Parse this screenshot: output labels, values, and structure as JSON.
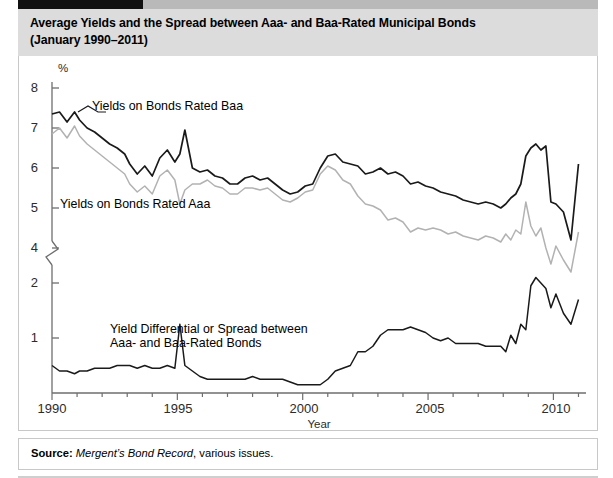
{
  "figure": {
    "title_line1": "Average Yields and the Spread between Aaa- and Baa-Rated Municipal Bonds",
    "title_line2": "(January 1990–2011)",
    "source_lead": "Source:",
    "source_italic": "Mergent’s Bond Record",
    "source_tail": ", various issues."
  },
  "annotations": {
    "baa_label": "Yields on Bonds Rated Baa",
    "aaa_label": "Yields on Bonds Rated Aaa",
    "spread_label_line1": "Yield Differential or Spread between",
    "spread_label_line2": "Aaa- and Baa-Rated Bonds"
  },
  "colors": {
    "baa_line": "#1a1a1a",
    "aaa_line": "#b2b2b2",
    "spread_line": "#1a1a1a",
    "axis": "#6e6e6e",
    "title_band": "#dcdcdc",
    "tab": "#111111"
  },
  "chart_data": {
    "type": "line",
    "title": "Average Yields and the Spread between Aaa- and Baa-Rated Municipal Bonds (January 1990–2011)",
    "xlabel": "Year",
    "ylabel": "%",
    "grid": false,
    "legend_position": "inline-annotations",
    "axis_note": "Y axis is broken between 4 and 2 (zigzag break mark); upper segment 4–8 for yields, lower segment 0–2 for the spread",
    "xlim": [
      1990,
      2011.3
    ],
    "xticks": [
      1990,
      1995,
      2000,
      2005,
      2010
    ],
    "xtick_labels": [
      "1990",
      "1995",
      "2000",
      "2005",
      "2010"
    ],
    "xminor_step": 1,
    "yticks_upper": [
      4,
      5,
      6,
      7,
      8
    ],
    "ytick_labels_upper": [
      "4",
      "5",
      "6",
      "7",
      "8"
    ],
    "yticks_lower": [
      1,
      2
    ],
    "ytick_labels_lower": [
      "1",
      "2"
    ],
    "ylim_upper": [
      3.4,
      8.3
    ],
    "ylim_lower": [
      0,
      2.35
    ],
    "series": [
      {
        "name": "Yields on Bonds Rated Baa",
        "axis": "upper",
        "color": "#1a1a1a",
        "x": [
          1990.0,
          1990.3,
          1990.6,
          1990.9,
          1991.1,
          1991.4,
          1991.7,
          1992.0,
          1992.3,
          1992.6,
          1992.9,
          1993.1,
          1993.4,
          1993.7,
          1994.0,
          1994.3,
          1994.6,
          1994.9,
          1995.1,
          1995.3,
          1995.6,
          1995.9,
          1996.2,
          1996.5,
          1996.8,
          1997.1,
          1997.4,
          1997.7,
          1998.0,
          1998.3,
          1998.6,
          1998.9,
          1999.2,
          1999.5,
          1999.8,
          2000.1,
          2000.4,
          2000.7,
          2001.0,
          2001.3,
          2001.6,
          2001.9,
          2002.2,
          2002.5,
          2002.8,
          2003.1,
          2003.4,
          2003.7,
          2004.0,
          2004.3,
          2004.6,
          2004.9,
          2005.2,
          2005.5,
          2005.8,
          2006.1,
          2006.4,
          2006.7,
          2007.0,
          2007.3,
          2007.6,
          2007.9,
          2008.1,
          2008.3,
          2008.5,
          2008.7,
          2008.9,
          2009.1,
          2009.3,
          2009.5,
          2009.7,
          2009.9,
          2010.1,
          2010.4,
          2010.7,
          2011.0
        ],
        "y": [
          7.35,
          7.4,
          7.15,
          7.4,
          7.2,
          7.0,
          6.9,
          6.75,
          6.6,
          6.5,
          6.35,
          6.1,
          5.85,
          6.05,
          5.8,
          6.25,
          6.45,
          6.15,
          6.35,
          6.95,
          6.0,
          5.9,
          5.95,
          5.8,
          5.75,
          5.6,
          5.6,
          5.75,
          5.8,
          5.7,
          5.75,
          5.6,
          5.45,
          5.35,
          5.4,
          5.55,
          5.6,
          6.0,
          6.3,
          6.35,
          6.15,
          6.1,
          6.05,
          5.85,
          5.9,
          6.0,
          5.85,
          5.9,
          5.8,
          5.6,
          5.65,
          5.55,
          5.5,
          5.4,
          5.35,
          5.3,
          5.2,
          5.15,
          5.1,
          5.15,
          5.1,
          5.0,
          5.1,
          5.25,
          5.35,
          5.6,
          6.3,
          6.5,
          6.6,
          6.45,
          6.55,
          5.15,
          5.1,
          4.9,
          4.2,
          6.1
        ]
      },
      {
        "name": "Yields on Bonds Rated Aaa",
        "axis": "upper",
        "color": "#b2b2b2",
        "x": [
          1990.0,
          1990.3,
          1990.6,
          1990.9,
          1991.1,
          1991.4,
          1991.7,
          1992.0,
          1992.3,
          1992.6,
          1992.9,
          1993.1,
          1993.4,
          1993.7,
          1994.0,
          1994.3,
          1994.6,
          1994.9,
          1995.1,
          1995.3,
          1995.6,
          1995.9,
          1996.2,
          1996.5,
          1996.8,
          1997.1,
          1997.4,
          1997.7,
          1998.0,
          1998.3,
          1998.6,
          1998.9,
          1999.2,
          1999.5,
          1999.8,
          2000.1,
          2000.4,
          2000.7,
          2001.0,
          2001.3,
          2001.6,
          2001.9,
          2002.2,
          2002.5,
          2002.8,
          2003.1,
          2003.4,
          2003.7,
          2004.0,
          2004.3,
          2004.6,
          2004.9,
          2005.2,
          2005.5,
          2005.8,
          2006.1,
          2006.4,
          2006.7,
          2007.0,
          2007.3,
          2007.6,
          2007.9,
          2008.1,
          2008.3,
          2008.5,
          2008.7,
          2008.9,
          2009.1,
          2009.3,
          2009.5,
          2009.7,
          2009.9,
          2010.1,
          2010.4,
          2010.7,
          2011.0
        ],
        "y": [
          6.85,
          7.0,
          6.75,
          7.05,
          6.8,
          6.6,
          6.45,
          6.3,
          6.15,
          6.0,
          5.85,
          5.6,
          5.4,
          5.55,
          5.35,
          5.8,
          5.95,
          5.7,
          5.1,
          5.45,
          5.6,
          5.6,
          5.7,
          5.55,
          5.5,
          5.35,
          5.35,
          5.5,
          5.5,
          5.45,
          5.5,
          5.35,
          5.2,
          5.15,
          5.25,
          5.4,
          5.45,
          5.85,
          6.05,
          5.95,
          5.7,
          5.6,
          5.3,
          5.1,
          5.05,
          4.95,
          4.7,
          4.75,
          4.65,
          4.4,
          4.5,
          4.45,
          4.5,
          4.45,
          4.35,
          4.4,
          4.3,
          4.25,
          4.2,
          4.3,
          4.25,
          4.15,
          4.35,
          4.2,
          4.45,
          4.35,
          5.15,
          4.55,
          4.3,
          4.5,
          4.0,
          3.6,
          4.05,
          3.7,
          3.4,
          4.4
        ]
      },
      {
        "name": "Yield Differential or Spread between Aaa- and Baa-Rated Bonds",
        "axis": "lower",
        "color": "#1a1a1a",
        "x": [
          1990.0,
          1990.3,
          1990.6,
          1990.9,
          1991.1,
          1991.4,
          1991.7,
          1992.0,
          1992.3,
          1992.6,
          1992.9,
          1993.1,
          1993.4,
          1993.7,
          1994.0,
          1994.3,
          1994.6,
          1994.9,
          1995.1,
          1995.3,
          1995.6,
          1995.9,
          1996.2,
          1996.5,
          1996.8,
          1997.1,
          1997.4,
          1997.7,
          1998.0,
          1998.3,
          1998.6,
          1998.9,
          1999.2,
          1999.5,
          1999.8,
          2000.1,
          2000.4,
          2000.7,
          2001.0,
          2001.3,
          2001.6,
          2001.9,
          2002.2,
          2002.5,
          2002.8,
          2003.1,
          2003.4,
          2003.7,
          2004.0,
          2004.3,
          2004.6,
          2004.9,
          2005.2,
          2005.5,
          2005.8,
          2006.1,
          2006.4,
          2006.7,
          2007.0,
          2007.3,
          2007.6,
          2007.9,
          2008.1,
          2008.3,
          2008.5,
          2008.7,
          2008.9,
          2009.1,
          2009.3,
          2009.5,
          2009.7,
          2009.9,
          2010.1,
          2010.4,
          2010.7,
          2011.0
        ],
        "y": [
          0.5,
          0.4,
          0.4,
          0.35,
          0.4,
          0.4,
          0.45,
          0.45,
          0.45,
          0.5,
          0.5,
          0.5,
          0.45,
          0.5,
          0.45,
          0.45,
          0.5,
          0.45,
          1.25,
          0.5,
          0.4,
          0.3,
          0.25,
          0.25,
          0.25,
          0.25,
          0.25,
          0.25,
          0.3,
          0.25,
          0.25,
          0.25,
          0.25,
          0.2,
          0.15,
          0.15,
          0.15,
          0.15,
          0.25,
          0.4,
          0.45,
          0.5,
          0.75,
          0.75,
          0.85,
          1.05,
          1.15,
          1.15,
          1.15,
          1.2,
          1.15,
          1.1,
          1.0,
          0.95,
          1.0,
          0.9,
          0.9,
          0.9,
          0.9,
          0.85,
          0.85,
          0.85,
          0.75,
          1.05,
          0.9,
          1.25,
          1.15,
          1.95,
          2.1,
          2.0,
          1.9,
          1.55,
          1.8,
          1.45,
          1.25,
          1.7
        ]
      }
    ]
  }
}
